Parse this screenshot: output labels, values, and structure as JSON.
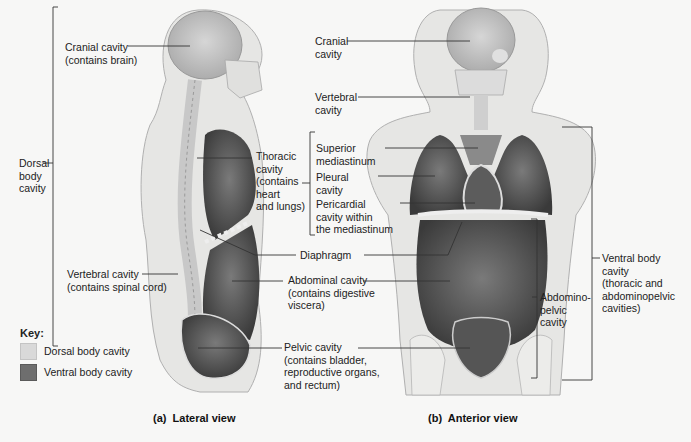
{
  "colors": {
    "background": "#f7f7f6",
    "dorsal_cavity": "#d9d9d9",
    "ventral_cavity": "#6e6e6e",
    "body_tissue": "#e6e6e4",
    "leader_line": "#333333"
  },
  "lateral_view": {
    "caption": "(a)  Lateral view",
    "labels": {
      "cranial": "Cranial cavity\n(contains brain)",
      "dorsal_bracket": "Dorsal\nbody\ncavity",
      "thoracic": "Thoracic\ncavity\n(contains\nheart\nand lungs)",
      "vertebral": "Vertebral cavity\n(contains spinal cord)",
      "diaphragm": "Diaphragm",
      "abdominal": "Abdominal cavity\n(contains digestive\nviscera)",
      "pelvic": "Pelvic cavity\n(contains bladder,\nreproductive organs,\nand rectum)"
    }
  },
  "anterior_view": {
    "caption": "(b)  Anterior view",
    "labels": {
      "cranial": "Cranial\ncavity",
      "vertebral": "Vertebral\ncavity",
      "superior_mediastinum": "Superior\nmediastinum",
      "pleural": "Pleural\ncavity",
      "pericardial": "Pericardial\ncavity within\nthe mediastinum",
      "abdominopelvic": "Abdomino-\npelvic\ncavity",
      "ventral_bracket": "Ventral body\ncavity\n(thoracic and\nabdominopelvic\ncavities)"
    }
  },
  "key": {
    "title": "Key:",
    "items": [
      {
        "label": "Dorsal body cavity",
        "color": "#d9d9d9"
      },
      {
        "label": "Ventral body cavity",
        "color": "#6e6e6e"
      }
    ]
  }
}
